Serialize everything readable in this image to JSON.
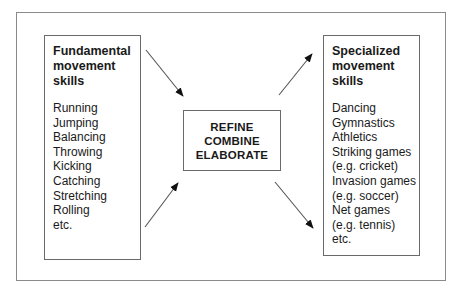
{
  "diagram": {
    "left_box": {
      "title_lines": [
        "Fundamental",
        "movement",
        "skills"
      ],
      "items": [
        "Running",
        "Jumping",
        "Balancing",
        "Throwing",
        "Kicking",
        "Catching",
        "Stretching",
        "Rolling",
        "etc."
      ]
    },
    "center_box": {
      "lines": [
        "REFINE",
        "COMBINE",
        "ELABORATE"
      ]
    },
    "right_box": {
      "title_lines": [
        "Specialized",
        "movement",
        "skills"
      ],
      "items": [
        "Dancing",
        "Gymnastics",
        "Athletics",
        "Striking games",
        "(e.g. cricket)",
        "Invasion games",
        "(e.g. soccer)",
        "Net games",
        "(e.g. tennis)",
        "etc."
      ]
    },
    "arrows": [
      {
        "name": "arrow-left-top-to-center",
        "from": [
          146,
          50
        ],
        "to": [
          183,
          96
        ]
      },
      {
        "name": "arrow-left-bottom-to-center",
        "from": [
          145,
          227
        ],
        "to": [
          178,
          183
        ]
      },
      {
        "name": "arrow-center-to-right-top",
        "from": [
          279,
          95
        ],
        "to": [
          312,
          54
        ]
      },
      {
        "name": "arrow-center-to-right-bottom",
        "from": [
          275,
          182
        ],
        "to": [
          313,
          228
        ]
      }
    ],
    "colors": {
      "line": "#555555",
      "text": "#1a1a1a",
      "outer_border": "#8a8a8a"
    }
  }
}
